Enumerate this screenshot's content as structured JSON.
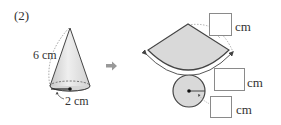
{
  "problem": {
    "number_label": "(2)"
  },
  "cone": {
    "slant_height_label": "6 cm",
    "base_radius_label": "2 cm"
  },
  "arrow": {
    "icon": "right-arrow-icon"
  },
  "net": {
    "sector_radius_unit": "cm",
    "arc_length_unit": "cm",
    "circle_radius_unit": "cm",
    "fill_color": "#d9d9d9",
    "stroke_color": "#444444"
  }
}
